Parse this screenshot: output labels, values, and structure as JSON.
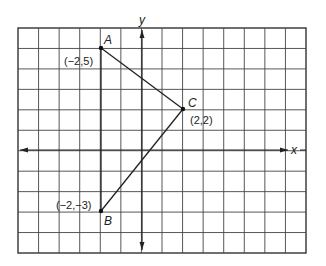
{
  "diagram": {
    "grid": {
      "columns": 14,
      "rows": 11,
      "x_min": -6,
      "x_max": 8,
      "y_min": -5,
      "y_max": 6
    },
    "axes": {
      "x_label": "x",
      "y_label": "y"
    },
    "points": [
      {
        "name": "A",
        "x": -2,
        "y": 5,
        "coord_label": "(−2,5)"
      },
      {
        "name": "C",
        "x": 2,
        "y": 2,
        "coord_label": "(2,2)"
      },
      {
        "name": "B",
        "x": -2,
        "y": -3,
        "coord_label": "(−2,−3)"
      }
    ],
    "segments": [
      [
        "A",
        "B"
      ],
      [
        "A",
        "C"
      ],
      [
        "C",
        "B"
      ]
    ],
    "colors": {
      "line": "#222222",
      "grid": "#333333",
      "background": "#ffffff"
    }
  }
}
